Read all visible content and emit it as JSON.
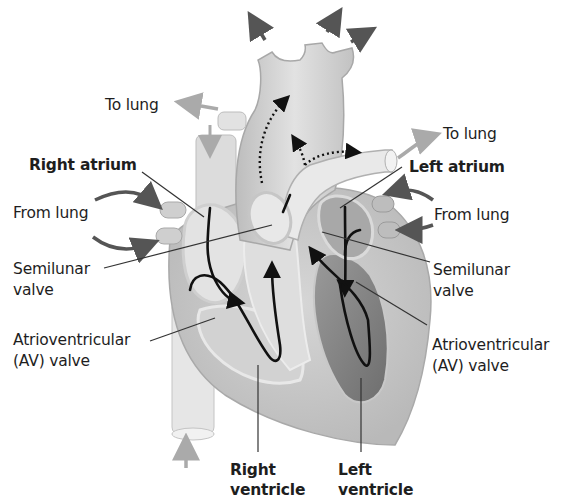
{
  "diagram": {
    "labels": {
      "to_lung_left": "To lung",
      "to_lung_right": "To lung",
      "right_atrium": "Right atrium",
      "left_atrium": "Left atrium",
      "from_lung_left": "From  lung",
      "from_lung_right": "From lung",
      "semilunar_left_1": "Semilunar",
      "semilunar_left_2": "valve",
      "semilunar_right_1": "Semilunar",
      "semilunar_right_2": "valve",
      "av_left_1": "Atrioventricular",
      "av_left_2": "(AV) valve",
      "av_right_1": "Atrioventricular",
      "av_right_2": "(AV) valve",
      "right_ventricle_1": "Right",
      "right_ventricle_2": "ventricle",
      "left_ventricle_1": "Left",
      "left_ventricle_2": "ventricle"
    },
    "colors": {
      "background": "#ffffff",
      "tissue_light": "#e4e4e4",
      "tissue_mid": "#c9c9c9",
      "tissue_dark": "#8f8f8f",
      "arrow_dark": "#555555",
      "arrow_light": "#aaaaaa",
      "flow_line": "#111111",
      "leader_line": "#333333"
    }
  }
}
